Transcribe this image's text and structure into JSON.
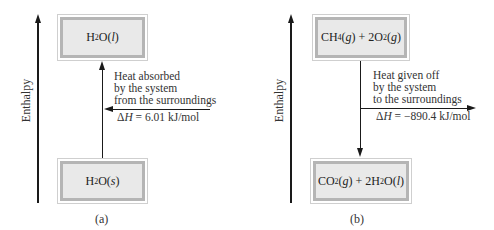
{
  "panels": [
    {
      "id": "a",
      "caption": "(a)",
      "axis_label": "Enthalpy",
      "top_state": {
        "formula": "H2O(l)",
        "display": [
          "H",
          "2",
          "O(",
          "l",
          ")"
        ]
      },
      "bottom_state": {
        "formula": "H2O(s)",
        "display": [
          "H",
          "2",
          "O(",
          "s",
          ")"
        ]
      },
      "arrow_direction": "up",
      "heat_arrow_direction": "in",
      "note_lines": [
        "Heat absorbed",
        "by the system",
        "from the surroundings"
      ],
      "delta_h_symbol": "ΔH",
      "delta_h_text": " = 6.01 kJ/mol",
      "delta_h_value": 6.01,
      "delta_h_unit": "kJ/mol"
    },
    {
      "id": "b",
      "caption": "(b)",
      "axis_label": "Enthalpy",
      "top_state": {
        "formula": "CH4(g) + 2O2(g)",
        "display": [
          "CH",
          "4",
          "(",
          "g",
          ") + 2O",
          "2",
          "(",
          "g",
          ")"
        ]
      },
      "bottom_state": {
        "formula": "CO2(g) + 2H2O(l)",
        "display": [
          "CO",
          "2",
          "(",
          "g",
          ") + 2H",
          "2",
          "O(",
          "l",
          ")"
        ]
      },
      "arrow_direction": "down",
      "heat_arrow_direction": "out",
      "note_lines": [
        "Heat given off",
        "by the system",
        "to the surroundings"
      ],
      "delta_h_symbol": "ΔH",
      "delta_h_text": " = −890.4 kJ/mol",
      "delta_h_value": -890.4,
      "delta_h_unit": "kJ/mol"
    }
  ]
}
